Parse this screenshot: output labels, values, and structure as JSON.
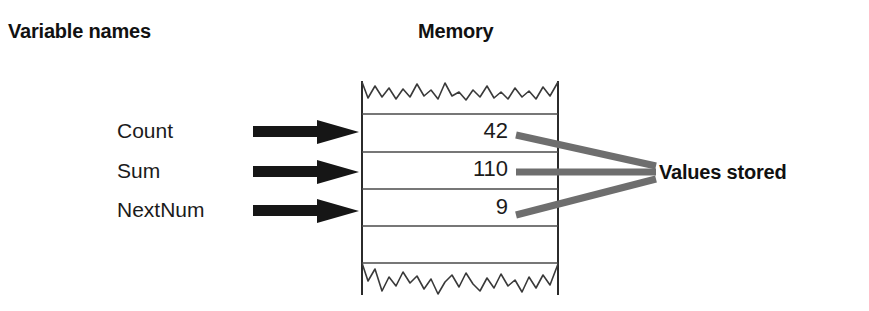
{
  "diagram": {
    "title_left": "Variable names",
    "title_center": "Memory",
    "callout_right": "Values stored",
    "variables": [
      {
        "name": "Count",
        "value": "42",
        "arrow": "right-arrow-icon"
      },
      {
        "name": "Sum",
        "value": "110",
        "arrow": "right-arrow-icon"
      },
      {
        "name": "NextNum",
        "value": "9",
        "arrow": "right-arrow-icon"
      }
    ],
    "memory_rows": [
      {
        "value": "42"
      },
      {
        "value": "110"
      },
      {
        "value": "9"
      },
      {
        "value": ""
      },
      {
        "value": ""
      }
    ],
    "colors": {
      "ink": "#111111",
      "arrow": "#161616",
      "connector": "#6e6e6e",
      "box_outline": "#2b2b2b",
      "divider": "#4a4a4a",
      "background": "#ffffff"
    },
    "edges": {
      "top": "torn-jagged-edge",
      "bottom": "torn-jagged-edge"
    }
  }
}
